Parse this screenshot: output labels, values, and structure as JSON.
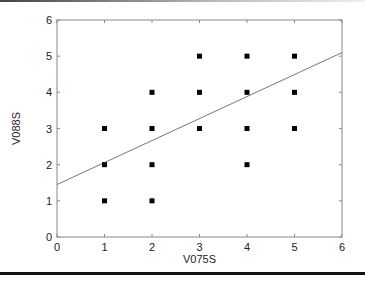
{
  "chart_data": {
    "type": "scatter",
    "title": "",
    "xlabel": "V075S",
    "ylabel": "V088S",
    "xlim": [
      0,
      6
    ],
    "ylim": [
      0,
      6
    ],
    "xticks": [
      "0",
      "1",
      "2",
      "3",
      "4",
      "5",
      "6"
    ],
    "yticks": [
      "0",
      "1",
      "2",
      "3",
      "4",
      "5",
      "6"
    ],
    "grid": false,
    "legend": null,
    "series": [
      {
        "name": "observations",
        "marker": "square",
        "color": "#000000",
        "points": [
          {
            "x": 1,
            "y": 3
          },
          {
            "x": 1,
            "y": 2
          },
          {
            "x": 1,
            "y": 1
          },
          {
            "x": 2,
            "y": 4
          },
          {
            "x": 2,
            "y": 3
          },
          {
            "x": 2,
            "y": 2
          },
          {
            "x": 2,
            "y": 1
          },
          {
            "x": 3,
            "y": 5
          },
          {
            "x": 3,
            "y": 4
          },
          {
            "x": 3,
            "y": 3
          },
          {
            "x": 4,
            "y": 5
          },
          {
            "x": 4,
            "y": 4
          },
          {
            "x": 4,
            "y": 3
          },
          {
            "x": 4,
            "y": 2
          },
          {
            "x": 5,
            "y": 5
          },
          {
            "x": 5,
            "y": 4
          },
          {
            "x": 5,
            "y": 3
          }
        ]
      },
      {
        "name": "regression line",
        "type": "line",
        "color": "#777777",
        "points": [
          {
            "x": 0,
            "y": 1.45
          },
          {
            "x": 6,
            "y": 5.1
          }
        ]
      }
    ]
  }
}
